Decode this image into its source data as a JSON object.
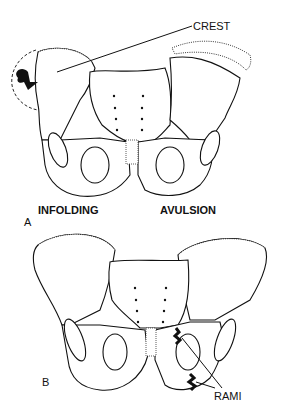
{
  "figure": {
    "panel_a": {
      "panel_label": "A",
      "labels": {
        "crest": "CREST",
        "left_caption": "INFOLDING",
        "right_caption": "AVULSION"
      }
    },
    "panel_b": {
      "panel_label": "B",
      "labels": {
        "rami": "RAMI"
      }
    }
  }
}
